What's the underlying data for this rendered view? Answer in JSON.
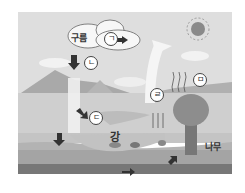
{
  "diagram": {
    "labels": {
      "cloud": "구름",
      "river": "강",
      "tree": "나무"
    },
    "markers": {
      "a": "ㄱ",
      "b": "ㄴ",
      "c": "ㄷ",
      "d": "ㄹ",
      "e": "ㅁ"
    },
    "colors": {
      "sky": "#dcdcdc",
      "ground": "#c8c8c8",
      "soil": "#a8a8a8",
      "water": "#b8b8b8",
      "deep": "#6e6e6e"
    }
  }
}
